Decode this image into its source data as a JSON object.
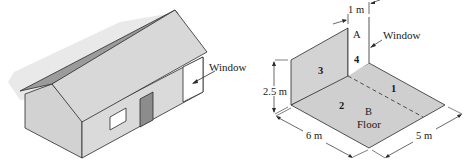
{
  "figure": {
    "left_panel": {
      "name": "house",
      "labels": {
        "window": "Window"
      }
    },
    "right_panel": {
      "name": "room-geometry",
      "labels": {
        "width_window": "1 m",
        "window": "Window",
        "surface_a": "A",
        "surface_b": "B",
        "surface_1": "1",
        "surface_2": "2",
        "surface_3": "3",
        "surface_4": "4",
        "height": "2.5 m",
        "floor": "Floor",
        "length": "6 m",
        "depth": "5 m"
      }
    },
    "colors": {
      "roof_light": "#d9d9d9",
      "roof_dark": "#9a9a9a",
      "wall_front": "#d4d4d4",
      "wall_side": "#c8c8c8",
      "door": "#8e8e8e",
      "shadow": "#e8e8e8",
      "floor": "#cfcfcf",
      "wall3": "#d3d3d3",
      "line": "#2a2a2a"
    }
  }
}
